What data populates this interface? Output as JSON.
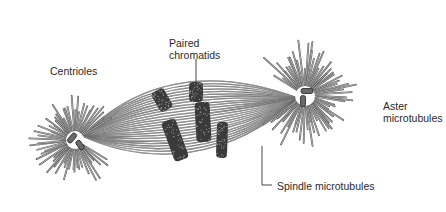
{
  "diagram": {
    "labels": {
      "centrioles": "Centrioles",
      "paired_chromatids_line1": "Paired",
      "paired_chromatids_line2": "chromatids",
      "aster_line1": "Aster",
      "aster_line2": "microtubules",
      "spindle": "Spindle microtubules"
    },
    "components": [
      {
        "name": "left-aster",
        "center": [
          75,
          140
        ]
      },
      {
        "name": "right-aster",
        "center": [
          305,
          95
        ]
      },
      {
        "name": "chromatid-pairs",
        "count": 3
      }
    ],
    "colors": {
      "line": "#555555",
      "chromatid": "#3a3a3a",
      "text": "#2a2a2a",
      "background": "#ffffff"
    }
  }
}
